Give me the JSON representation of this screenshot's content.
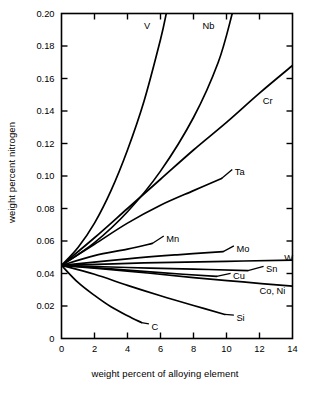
{
  "chart_data": {
    "type": "line",
    "title": "",
    "xlabel": "weight percent of alloying element",
    "ylabel": "weight percent nitrogen",
    "xlim": [
      0,
      14
    ],
    "ylim": [
      0,
      0.2
    ],
    "xticks": [
      "0",
      "2",
      "4",
      "6",
      "8",
      "10",
      "12",
      "14"
    ],
    "xtick_values": [
      0,
      2,
      4,
      6,
      8,
      10,
      12,
      14
    ],
    "yticks": [
      "0",
      "0.02",
      "0.04",
      "0.06",
      "0.08",
      "0.10",
      "0.12",
      "0.14",
      "0.16",
      "0.18",
      "0.20"
    ],
    "ytick_values": [
      0,
      0.02,
      0.04,
      0.06,
      0.08,
      0.1,
      0.12,
      0.14,
      0.16,
      0.18,
      0.2
    ],
    "grid": false,
    "legend": "inline-curve-labels",
    "origin_value": 0.045,
    "line_color": "#000000",
    "series": [
      {
        "name": "V",
        "label": "V",
        "label_x": 5.0,
        "label_y": 0.1925,
        "leader": false,
        "points": [
          [
            0,
            0.045
          ],
          [
            1,
            0.056
          ],
          [
            2,
            0.071
          ],
          [
            3,
            0.091
          ],
          [
            4,
            0.116
          ],
          [
            5,
            0.146
          ],
          [
            6,
            0.184
          ],
          [
            6.35,
            0.2
          ]
        ]
      },
      {
        "name": "Nb",
        "label": "Nb",
        "label_x": 8.55,
        "label_y": 0.1925,
        "leader": false,
        "points": [
          [
            0,
            0.045
          ],
          [
            2,
            0.059
          ],
          [
            4,
            0.078
          ],
          [
            6,
            0.103
          ],
          [
            8,
            0.136
          ],
          [
            9.5,
            0.17
          ],
          [
            10.35,
            0.2
          ]
        ]
      },
      {
        "name": "Cr",
        "label": "Cr",
        "label_x": 12.2,
        "label_y": 0.1465,
        "leader": false,
        "points": [
          [
            0,
            0.045
          ],
          [
            2,
            0.062
          ],
          [
            4,
            0.08
          ],
          [
            6,
            0.098
          ],
          [
            8,
            0.116
          ],
          [
            10,
            0.133
          ],
          [
            12,
            0.151
          ],
          [
            14,
            0.168
          ]
        ]
      },
      {
        "name": "Ta",
        "label": "Ta",
        "label_x": 10.5,
        "label_y": 0.1025,
        "leader": true,
        "leader_to": [
          9.7,
          0.0985
        ],
        "points": [
          [
            0,
            0.045
          ],
          [
            2,
            0.058
          ],
          [
            4,
            0.071
          ],
          [
            6,
            0.082
          ],
          [
            8,
            0.091
          ],
          [
            9.7,
            0.0985
          ]
        ]
      },
      {
        "name": "Mn",
        "label": "Mn",
        "label_x": 6.35,
        "label_y": 0.0615,
        "leader": true,
        "leader_to": [
          5.5,
          0.0585
        ],
        "points": [
          [
            0,
            0.045
          ],
          [
            2,
            0.051
          ],
          [
            4,
            0.055
          ],
          [
            5.5,
            0.0585
          ]
        ]
      },
      {
        "name": "Mo",
        "label": "Mo",
        "label_x": 10.6,
        "label_y": 0.0555,
        "leader": true,
        "leader_to": [
          9.8,
          0.0535
        ],
        "points": [
          [
            0,
            0.045
          ],
          [
            4,
            0.049
          ],
          [
            7,
            0.0515
          ],
          [
            9.8,
            0.0535
          ]
        ]
      },
      {
        "name": "W",
        "label": "W",
        "label_x": 13.5,
        "label_y": 0.0495,
        "leader": false,
        "points": [
          [
            0,
            0.045
          ],
          [
            5,
            0.0465
          ],
          [
            10,
            0.0475
          ],
          [
            14,
            0.0482
          ]
        ]
      },
      {
        "name": "Sn",
        "label": "Sn",
        "label_x": 12.4,
        "label_y": 0.0428,
        "leader": true,
        "leader_to": [
          11.3,
          0.0418
        ],
        "points": [
          [
            0,
            0.045
          ],
          [
            4,
            0.0437
          ],
          [
            8,
            0.0427
          ],
          [
            11.3,
            0.0418
          ]
        ]
      },
      {
        "name": "Cu",
        "label": "Cu",
        "label_x": 10.4,
        "label_y": 0.0385,
        "leader": true,
        "leader_to": [
          9.4,
          0.0382
        ],
        "points": [
          [
            0,
            0.045
          ],
          [
            3,
            0.0429
          ],
          [
            6,
            0.0405
          ],
          [
            9.4,
            0.0382
          ]
        ]
      },
      {
        "name": "Co, Ni",
        "label": "Co, Ni",
        "label_x": 12.0,
        "label_y": 0.0295,
        "leader": false,
        "points": [
          [
            0,
            0.045
          ],
          [
            4,
            0.0415
          ],
          [
            8,
            0.0375
          ],
          [
            11,
            0.0348
          ],
          [
            14,
            0.0322
          ]
        ]
      },
      {
        "name": "Si",
        "label": "Si",
        "label_x": 10.6,
        "label_y": 0.0128,
        "leader": true,
        "leader_to": [
          9.9,
          0.0148
        ],
        "points": [
          [
            0,
            0.045
          ],
          [
            2,
            0.0395
          ],
          [
            4,
            0.0327
          ],
          [
            6,
            0.0263
          ],
          [
            8,
            0.0203
          ],
          [
            9.9,
            0.0148
          ]
        ]
      },
      {
        "name": "C",
        "label": "C",
        "label_x": 5.45,
        "label_y": 0.0075,
        "leader": true,
        "leader_to": [
          4.85,
          0.0098
        ],
        "points": [
          [
            0,
            0.045
          ],
          [
            1,
            0.0345
          ],
          [
            2,
            0.0265
          ],
          [
            3,
            0.0195
          ],
          [
            4,
            0.014
          ],
          [
            4.85,
            0.0098
          ]
        ]
      }
    ]
  }
}
